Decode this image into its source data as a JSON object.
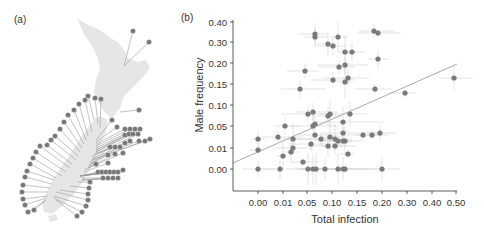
{
  "panels": {
    "a_label": "(a)",
    "b_label": "(b)"
  },
  "map": {
    "description": "Map of New Zealand with site markers (pie-style circles) connected by leader lines",
    "land_color": "#e6e6e6",
    "marker_color": "#777777",
    "line_color": "#999999"
  },
  "chart_data": {
    "type": "scatter",
    "title": "",
    "xlabel": "Total infection",
    "ylabel": "Male frequency",
    "x_ticks": [
      "0.00",
      "0.01",
      "0.05",
      "0.10",
      "0.15",
      "0.20",
      "0.30",
      "0.40",
      "0.50"
    ],
    "y_ticks": [
      "0.40",
      "0.30",
      "0.20",
      "0.15",
      "0.10",
      "0.05",
      "0.01",
      "0.00"
    ],
    "x_scale": "non-linear (transformed)",
    "y_scale": "non-linear (transformed)",
    "grid": false,
    "error_bars": true,
    "regression_line": {
      "from": [
        -0.002,
        0.005
      ],
      "to": [
        0.5,
        0.22
      ]
    },
    "point_color": "#7a7a7a",
    "errorbar_color": "#d0d0d0",
    "line_color": "#aaaaaa",
    "points_px": [
      [
        315,
        34
      ],
      [
        315,
        37
      ],
      [
        338,
        37
      ],
      [
        374,
        31
      ],
      [
        378,
        33
      ],
      [
        328,
        44
      ],
      [
        333,
        46
      ],
      [
        345,
        52
      ],
      [
        352,
        52
      ],
      [
        378,
        59
      ],
      [
        339,
        67
      ],
      [
        345,
        65
      ],
      [
        305,
        71
      ],
      [
        333,
        80
      ],
      [
        345,
        82
      ],
      [
        348,
        78
      ],
      [
        300,
        89
      ],
      [
        375,
        89
      ],
      [
        405,
        93
      ],
      [
        454,
        78
      ],
      [
        308,
        114
      ],
      [
        313,
        112
      ],
      [
        328,
        116
      ],
      [
        330,
        114
      ],
      [
        350,
        114
      ],
      [
        343,
        122
      ],
      [
        313,
        126
      ],
      [
        315,
        124
      ],
      [
        285,
        126
      ],
      [
        343,
        133
      ],
      [
        258,
        139
      ],
      [
        278,
        137
      ],
      [
        293,
        139
      ],
      [
        315,
        135
      ],
      [
        321,
        139
      ],
      [
        330,
        137
      ],
      [
        335,
        139
      ],
      [
        338,
        141
      ],
      [
        343,
        141
      ],
      [
        345,
        141
      ],
      [
        363,
        135
      ],
      [
        372,
        135
      ],
      [
        380,
        133
      ],
      [
        258,
        150
      ],
      [
        293,
        148
      ],
      [
        291,
        152
      ],
      [
        283,
        156
      ],
      [
        311,
        144
      ],
      [
        328,
        146
      ],
      [
        335,
        146
      ],
      [
        348,
        154
      ],
      [
        303,
        162
      ],
      [
        258,
        169
      ],
      [
        280,
        169
      ],
      [
        308,
        169
      ],
      [
        313,
        169
      ],
      [
        316,
        169
      ],
      [
        325,
        169
      ],
      [
        338,
        169
      ],
      [
        343,
        169
      ],
      [
        345,
        169
      ],
      [
        382,
        169
      ]
    ],
    "points": [
      {
        "x": 0.065,
        "y": 0.33
      },
      {
        "x": 0.065,
        "y": 0.32
      },
      {
        "x": 0.11,
        "y": 0.32
      },
      {
        "x": 0.185,
        "y": 0.34
      },
      {
        "x": 0.19,
        "y": 0.335
      },
      {
        "x": 0.09,
        "y": 0.29
      },
      {
        "x": 0.1,
        "y": 0.28
      },
      {
        "x": 0.125,
        "y": 0.25
      },
      {
        "x": 0.14,
        "y": 0.25
      },
      {
        "x": 0.19,
        "y": 0.22
      },
      {
        "x": 0.115,
        "y": 0.18
      },
      {
        "x": 0.125,
        "y": 0.19
      },
      {
        "x": 0.045,
        "y": 0.17
      },
      {
        "x": 0.1,
        "y": 0.16
      },
      {
        "x": 0.125,
        "y": 0.155
      },
      {
        "x": 0.13,
        "y": 0.165
      },
      {
        "x": 0.035,
        "y": 0.14
      },
      {
        "x": 0.185,
        "y": 0.14
      },
      {
        "x": 0.29,
        "y": 0.13
      },
      {
        "x": 0.49,
        "y": 0.165
      },
      {
        "x": 0.05,
        "y": 0.08
      },
      {
        "x": 0.06,
        "y": 0.085
      },
      {
        "x": 0.09,
        "y": 0.075
      },
      {
        "x": 0.095,
        "y": 0.08
      },
      {
        "x": 0.135,
        "y": 0.08
      },
      {
        "x": 0.12,
        "y": 0.06
      },
      {
        "x": 0.06,
        "y": 0.05
      },
      {
        "x": 0.065,
        "y": 0.055
      },
      {
        "x": 0.01,
        "y": 0.05
      },
      {
        "x": 0.12,
        "y": 0.035
      },
      {
        "x": 0.0,
        "y": 0.02
      },
      {
        "x": 0.008,
        "y": 0.025
      },
      {
        "x": 0.02,
        "y": 0.02
      },
      {
        "x": 0.065,
        "y": 0.03
      },
      {
        "x": 0.075,
        "y": 0.02
      },
      {
        "x": 0.095,
        "y": 0.025
      },
      {
        "x": 0.105,
        "y": 0.02
      },
      {
        "x": 0.11,
        "y": 0.015
      },
      {
        "x": 0.12,
        "y": 0.015
      },
      {
        "x": 0.125,
        "y": 0.015
      },
      {
        "x": 0.16,
        "y": 0.03
      },
      {
        "x": 0.18,
        "y": 0.03
      },
      {
        "x": 0.195,
        "y": 0.035
      },
      {
        "x": 0.0,
        "y": 0.009
      },
      {
        "x": 0.02,
        "y": 0.01
      },
      {
        "x": 0.017,
        "y": 0.008
      },
      {
        "x": 0.01,
        "y": 0.006
      },
      {
        "x": 0.055,
        "y": 0.012
      },
      {
        "x": 0.09,
        "y": 0.011
      },
      {
        "x": 0.105,
        "y": 0.011
      },
      {
        "x": 0.13,
        "y": 0.007
      },
      {
        "x": 0.04,
        "y": 0.003
      },
      {
        "x": 0.0,
        "y": 0.0
      },
      {
        "x": 0.009,
        "y": 0.0
      },
      {
        "x": 0.05,
        "y": 0.0
      },
      {
        "x": 0.06,
        "y": 0.0
      },
      {
        "x": 0.065,
        "y": 0.0
      },
      {
        "x": 0.085,
        "y": 0.0
      },
      {
        "x": 0.11,
        "y": 0.0
      },
      {
        "x": 0.12,
        "y": 0.0
      },
      {
        "x": 0.125,
        "y": 0.0
      },
      {
        "x": 0.2,
        "y": 0.0
      }
    ]
  }
}
